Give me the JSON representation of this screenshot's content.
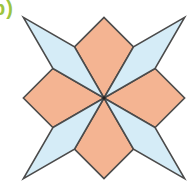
{
  "figure_label": {
    "text": "b)",
    "color": "#9dc43e"
  },
  "canvas": {
    "width": 195,
    "height": 183,
    "background": "#ffffff"
  },
  "figure": {
    "type": "geometry-diagram",
    "stroke_color": "#4b4b4b",
    "stroke_width": 1.6,
    "fill_colors": {
      "orange": "#f4b492",
      "blue": "#d5ecf7"
    },
    "center": {
      "x": 104,
      "y": 98
    },
    "center_dot_radius": 1.7,
    "center_dot_color": "#222222",
    "shapes": [
      {
        "name": "orange-kite-north",
        "fill": "orange",
        "points": "104,98 74.5,46.9 104,17.4 133.5,46.9"
      },
      {
        "name": "orange-kite-east",
        "fill": "orange",
        "points": "104,98 155.1,68.5 184.6,98 155.1,127.5"
      },
      {
        "name": "orange-kite-south",
        "fill": "orange",
        "points": "104,98 133.5,149.1 104,178.6 74.5,149.1"
      },
      {
        "name": "orange-kite-west",
        "fill": "orange",
        "points": "104,98 52.9,127.5 23.4,98 52.9,68.5"
      },
      {
        "name": "blue-rhombus-northeast",
        "fill": "blue",
        "points": "104,98 133.5,46.9 184.6,17.4 155.1,68.5"
      },
      {
        "name": "blue-rhombus-northwest",
        "fill": "blue",
        "points": "104,98 52.9,68.5 23.4,17.4 74.5,46.9"
      },
      {
        "name": "blue-rhombus-southeast",
        "fill": "blue",
        "points": "104,98 155.1,127.5 184.6,178.6 133.5,149.1"
      },
      {
        "name": "blue-rhombus-southwest",
        "fill": "blue",
        "points": "104,98 74.5,149.1 23.4,178.6 52.9,127.5"
      }
    ]
  }
}
